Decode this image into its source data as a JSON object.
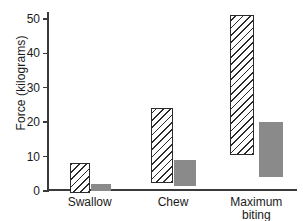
{
  "chart_data": {
    "type": "bar",
    "title": "",
    "xlabel": "",
    "ylabel": "Force (kilograms)",
    "ylim": [
      0,
      52
    ],
    "yticks": [
      0,
      10,
      20,
      30,
      40,
      50
    ],
    "ytick_labels": [
      "0",
      "10",
      "20",
      "30",
      "40",
      "50"
    ],
    "grid": false,
    "legend": "none",
    "categories": [
      "Swallow",
      "Chew",
      "Maximum\nbiting force"
    ],
    "note": "Floating (range) bars: each bar spans from a low value to a high value.",
    "series": [
      {
        "name": "hatched",
        "style": "diagonal-hatch",
        "lows": [
          0,
          3,
          11
        ],
        "highs": [
          8,
          24,
          51
        ],
        "values": [
          8,
          21,
          40
        ]
      },
      {
        "name": "solid-gray",
        "style": "solid",
        "color": "#8a8a8a",
        "lows": [
          0,
          1.5,
          4
        ],
        "highs": [
          2,
          9,
          20
        ],
        "values": [
          2,
          7.5,
          16
        ]
      }
    ]
  },
  "axis": {
    "line_color": "#3a3a3a",
    "tick_labels": [
      "50",
      "40",
      "30",
      "20",
      "10",
      "0"
    ]
  },
  "labels": {
    "swallow": "Swallow",
    "chew": "Chew",
    "maximum": "Maximum\nbiting force",
    "y_title": "Force (kilograms)"
  }
}
